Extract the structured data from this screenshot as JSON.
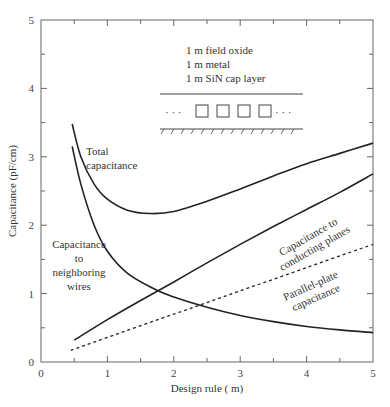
{
  "chart_data": {
    "type": "line",
    "title": "",
    "xlabel": "Design rule ( m)",
    "ylabel": "Capacitance (pF/cm)",
    "xlim": [
      0,
      5
    ],
    "ylim": [
      0,
      5
    ],
    "x_ticks": [
      "0",
      "1",
      "2",
      "3",
      "4",
      "5"
    ],
    "y_ticks": [
      "0",
      "1",
      "2",
      "3",
      "4",
      "5"
    ],
    "grid": false,
    "series": [
      {
        "name": "Total capacitance",
        "style": "solid",
        "x": [
          0.47,
          0.6,
          0.8,
          1.0,
          1.3,
          1.65,
          2.0,
          2.5,
          3.0,
          3.5,
          4.0,
          4.5,
          5.0
        ],
        "y": [
          3.48,
          3.0,
          2.6,
          2.38,
          2.22,
          2.17,
          2.2,
          2.35,
          2.53,
          2.72,
          2.9,
          3.05,
          3.2
        ]
      },
      {
        "name": "Capacitance to neighboring wires",
        "style": "solid",
        "x": [
          0.47,
          0.6,
          0.8,
          1.0,
          1.3,
          1.7,
          2.0,
          2.5,
          3.0,
          3.5,
          4.0,
          4.5,
          5.0
        ],
        "y": [
          3.15,
          2.6,
          2.0,
          1.62,
          1.3,
          1.07,
          0.95,
          0.8,
          0.68,
          0.59,
          0.52,
          0.47,
          0.43
        ]
      },
      {
        "name": "Capacitance to conducting planes",
        "style": "solid",
        "x": [
          0.5,
          1.0,
          1.5,
          2.0,
          2.5,
          3.0,
          3.5,
          4.0,
          4.5,
          5.0
        ],
        "y": [
          0.32,
          0.62,
          0.9,
          1.17,
          1.45,
          1.72,
          1.98,
          2.23,
          2.48,
          2.75
        ]
      },
      {
        "name": "Parallel-plate capacitance",
        "style": "dashed",
        "x": [
          0.45,
          1.0,
          2.0,
          3.0,
          4.0,
          5.0
        ],
        "y": [
          0.17,
          0.36,
          0.7,
          1.04,
          1.38,
          1.72
        ]
      }
    ],
    "annotations": {
      "total": [
        "Total",
        "capacitance"
      ],
      "neighbor": [
        "Capacitance",
        "to",
        "neighboring",
        "wires"
      ],
      "planes": [
        "Capacitance to",
        "conducting planes"
      ],
      "parallel": [
        "Parallel-plate",
        "capacitance"
      ],
      "inset_text": [
        "1  m field oxide",
        "1  m metal",
        "1  m SiN cap layer"
      ],
      "inset_dots_left": "· · ·",
      "inset_dots_right": "· · ·"
    }
  }
}
